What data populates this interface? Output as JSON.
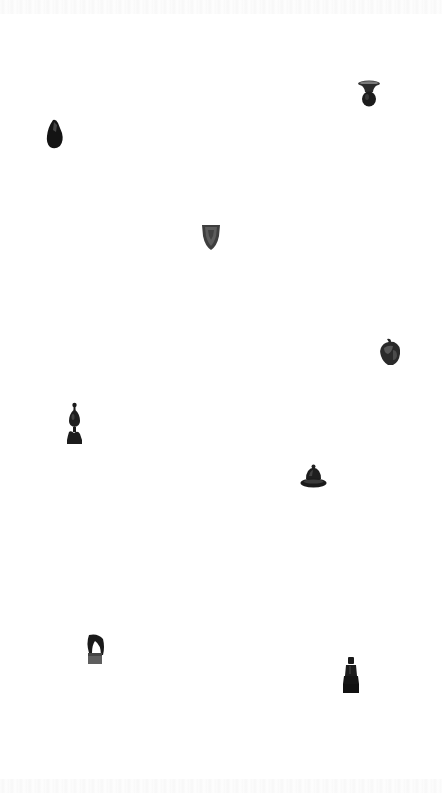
{
  "scene": {
    "background": "#ffffff",
    "artifact_color": "#1c1c1c"
  },
  "artifacts": [
    {
      "id": "vase",
      "icon": "vase-icon",
      "x": 357,
      "y": 80,
      "w": 24,
      "h": 28
    },
    {
      "id": "stone",
      "icon": "stone-icon",
      "x": 46,
      "y": 119,
      "w": 18,
      "h": 31
    },
    {
      "id": "shield",
      "icon": "shield-icon",
      "x": 201,
      "y": 224,
      "w": 20,
      "h": 27
    },
    {
      "id": "helmet",
      "icon": "helmet-icon",
      "x": 378,
      "y": 338,
      "w": 24,
      "h": 29
    },
    {
      "id": "figurine",
      "icon": "figurine-icon",
      "x": 65,
      "y": 402,
      "w": 19,
      "h": 43
    },
    {
      "id": "domed-bowl",
      "icon": "domed-bowl-icon",
      "x": 300,
      "y": 464,
      "w": 27,
      "h": 26
    },
    {
      "id": "blade",
      "icon": "blade-icon",
      "x": 86,
      "y": 633,
      "w": 20,
      "h": 32
    },
    {
      "id": "seated-statue",
      "icon": "seated-statue-icon",
      "x": 342,
      "y": 656,
      "w": 18,
      "h": 38
    }
  ]
}
